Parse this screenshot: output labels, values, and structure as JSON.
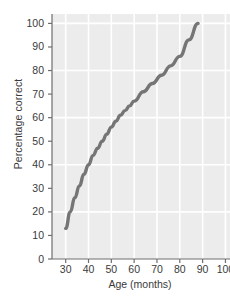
{
  "chart_data": {
    "type": "line",
    "title": "",
    "xlabel": "Age (months)",
    "ylabel": "Percentage correct",
    "xlim": [
      24,
      102
    ],
    "ylim": [
      0,
      104
    ],
    "xticks": [
      30,
      40,
      50,
      60,
      70,
      80,
      90,
      100
    ],
    "xticklabels": [
      "30",
      "40",
      "50",
      "60",
      "70",
      "80",
      "90",
      "100"
    ],
    "yticks": [
      0,
      10,
      20,
      30,
      40,
      50,
      60,
      70,
      80,
      90,
      100
    ],
    "yticklabels": [
      "0",
      "10",
      "20",
      "30",
      "40",
      "50",
      "60",
      "70",
      "80",
      "90",
      "100"
    ],
    "grid": true,
    "grid_color": "#ffffff",
    "plot_background": "#ececec",
    "figure_background": "#ffffff",
    "legend": null,
    "series": [
      {
        "name": "Percentage correct by age",
        "color": "#757575",
        "line_width": 3.4,
        "x": [
          30,
          32,
          34,
          36,
          38,
          40,
          42,
          44,
          46,
          48,
          50,
          52,
          54,
          56,
          58,
          60,
          64,
          68,
          72,
          76,
          80,
          84,
          88
        ],
        "values": [
          13,
          20,
          26,
          31,
          36,
          40,
          44,
          47,
          50,
          53,
          56,
          58.5,
          61,
          63,
          65,
          67,
          71,
          74.5,
          78,
          82,
          86,
          93,
          100
        ]
      }
    ],
    "annotations": []
  },
  "axis": {
    "y_title": "Percentage correct",
    "x_title": "Age (months)"
  }
}
